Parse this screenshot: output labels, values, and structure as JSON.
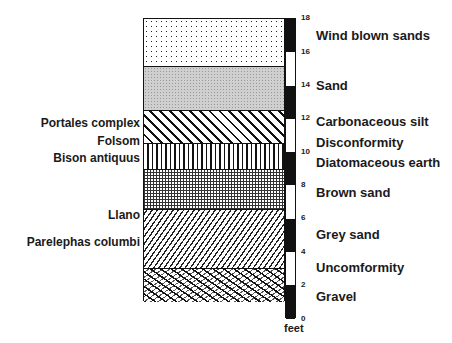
{
  "diagram": {
    "title": "",
    "unit_label": "feet",
    "scale": {
      "min_ft": 0,
      "max_ft": 18,
      "ticks": [
        "18",
        "16",
        "14",
        "12",
        "10",
        "8",
        "6",
        "4",
        "2",
        "0"
      ],
      "segments": [
        {
          "from": 16,
          "to": 18,
          "color": "#111111"
        },
        {
          "from": 14,
          "to": 16,
          "color": "#ffffff"
        },
        {
          "from": 12,
          "to": 14,
          "color": "#111111"
        },
        {
          "from": 10,
          "to": 12,
          "color": "#ffffff"
        },
        {
          "from": 8,
          "to": 10,
          "color": "#111111"
        },
        {
          "from": 6,
          "to": 8,
          "color": "#ffffff"
        },
        {
          "from": 4,
          "to": 6,
          "color": "#111111"
        },
        {
          "from": 2,
          "to": 4,
          "color": "#ffffff"
        },
        {
          "from": 0,
          "to": 2,
          "color": "#111111"
        }
      ]
    },
    "layers": [
      {
        "name": "Wind blown sands",
        "pattern": "stipple",
        "top_ft": 18,
        "bottom_ft": 15.1
      },
      {
        "name": "Sand",
        "pattern": "fine grey stipple",
        "top_ft": 15.1,
        "bottom_ft": 12.5
      },
      {
        "name": "Carbonaceous silt",
        "pattern": "diagonal hatch",
        "top_ft": 12.5,
        "bottom_ft": 10.5
      },
      {
        "name": "Diatomaceous earth",
        "pattern": "vertical lines",
        "top_ft": 10.5,
        "bottom_ft": 8.9
      },
      {
        "name": "Brown sand",
        "pattern": "grid dots",
        "top_ft": 8.9,
        "bottom_ft": 6.5
      },
      {
        "name": "Grey sand",
        "pattern": "dense diagonal",
        "top_ft": 6.5,
        "bottom_ft": 3.0
      },
      {
        "name": "Gravel",
        "pattern": "crosshatch",
        "top_ft": 3.0,
        "bottom_ft": 1.0
      }
    ],
    "right_labels": [
      {
        "text": "Wind blown sands",
        "y": 30
      },
      {
        "text": "Sand",
        "y": 80
      },
      {
        "text": "Carbonaceous silt",
        "y": 117
      },
      {
        "text": "Disconformity",
        "y": 137
      },
      {
        "text": "Diatomaceous earth",
        "y": 157
      },
      {
        "text": "Brown sand",
        "y": 187
      },
      {
        "text": "Grey sand",
        "y": 229
      },
      {
        "text": "Uncomformity",
        "y": 262
      },
      {
        "text": "Gravel",
        "y": 291
      }
    ],
    "left_labels": [
      {
        "text": "Portales complex",
        "y": 118
      },
      {
        "text": "Folsom",
        "y": 136
      },
      {
        "text": "Bison antiquus",
        "y": 153
      },
      {
        "text": "Llano",
        "y": 210
      },
      {
        "text": "Parelephas columbi",
        "y": 237
      }
    ]
  }
}
